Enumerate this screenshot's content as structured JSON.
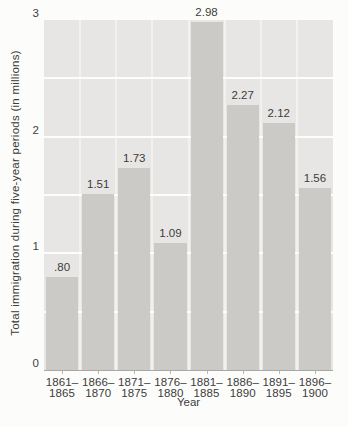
{
  "chart_data": {
    "type": "bar",
    "title": "",
    "xlabel": "Year",
    "ylabel": "Total immigration during five-year periods (in millions)",
    "categories": [
      {
        "line1": "1861–",
        "line2": "1865"
      },
      {
        "line1": "1866–",
        "line2": "1870"
      },
      {
        "line1": "1871–",
        "line2": "1875"
      },
      {
        "line1": "1876–",
        "line2": "1880"
      },
      {
        "line1": "1881–",
        "line2": "1885"
      },
      {
        "line1": "1886–",
        "line2": "1890"
      },
      {
        "line1": "1891–",
        "line2": "1895"
      },
      {
        "line1": "1896–",
        "line2": "1900"
      }
    ],
    "values": [
      0.8,
      1.51,
      1.73,
      1.09,
      2.98,
      2.27,
      2.12,
      1.56
    ],
    "value_labels": [
      ".80",
      "1.51",
      "1.73",
      "1.09",
      "2.98",
      "2.27",
      "2.12",
      "1.56"
    ],
    "ylim": [
      0,
      3
    ],
    "yticks": [
      "0",
      "1",
      "2",
      "3"
    ],
    "gridline_interval": 0.5,
    "legend": "none",
    "grid": "horizontal white gridlines every 0.5 unit; white vertical separators between bar columns",
    "colors": {
      "page_bg": "#fcfcfb",
      "plot_bg": "#e7e6e4",
      "bar": "#cbcac7",
      "gridline": "#fdfdfc",
      "separator": "#f2f1ef",
      "baseline": "#a9a8a5",
      "tick": "#b9b8b5",
      "text": "#3c3c3c"
    }
  }
}
